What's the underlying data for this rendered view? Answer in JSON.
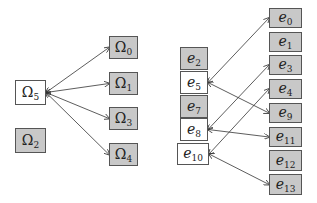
{
  "left_diagram": {
    "nodes": [
      {
        "id": "omega5",
        "base": "Ω",
        "sub": "5",
        "fill": "white",
        "x": 15,
        "y": 80,
        "w": 31,
        "h": 25
      },
      {
        "id": "omega2",
        "base": "Ω",
        "sub": "2",
        "fill": "gray",
        "x": 15,
        "y": 128,
        "w": 31,
        "h": 25
      },
      {
        "id": "omega0",
        "base": "Ω",
        "sub": "0",
        "fill": "gray",
        "x": 109,
        "y": 36,
        "w": 29,
        "h": 23
      },
      {
        "id": "omega1",
        "base": "Ω",
        "sub": "1",
        "fill": "gray",
        "x": 109,
        "y": 72,
        "w": 29,
        "h": 23
      },
      {
        "id": "omega3",
        "base": "Ω",
        "sub": "3",
        "fill": "gray",
        "x": 109,
        "y": 107,
        "w": 29,
        "h": 23
      },
      {
        "id": "omega4",
        "base": "Ω",
        "sub": "4",
        "fill": "gray",
        "x": 109,
        "y": 143,
        "w": 29,
        "h": 23
      }
    ],
    "edges": [
      {
        "from": "omega5",
        "to": "omega0",
        "type": "bidirectional"
      },
      {
        "from": "omega5",
        "to": "omega1",
        "type": "bidirectional"
      },
      {
        "from": "omega5",
        "to": "omega3",
        "type": "bidirectional"
      },
      {
        "from": "omega5",
        "to": "omega4",
        "type": "bidirectional"
      }
    ]
  },
  "right_diagram": {
    "nodes": [
      {
        "id": "e2",
        "base": "e",
        "sub": "2",
        "fill": "gray",
        "x": 180,
        "y": 47,
        "w": 28,
        "h": 23
      },
      {
        "id": "e5",
        "base": "e",
        "sub": "5",
        "fill": "white",
        "x": 180,
        "y": 71,
        "w": 28,
        "h": 23
      },
      {
        "id": "e7",
        "base": "e",
        "sub": "7",
        "fill": "gray",
        "x": 180,
        "y": 95,
        "w": 28,
        "h": 23
      },
      {
        "id": "e8",
        "base": "e",
        "sub": "8",
        "fill": "white",
        "x": 180,
        "y": 118,
        "w": 28,
        "h": 23
      },
      {
        "id": "e10",
        "base": "e",
        "sub": "10",
        "fill": "white",
        "x": 177,
        "y": 143,
        "w": 32,
        "h": 22
      },
      {
        "id": "e0",
        "base": "e",
        "sub": "0",
        "fill": "gray",
        "x": 269,
        "y": 8,
        "w": 33,
        "h": 20
      },
      {
        "id": "e1",
        "base": "e",
        "sub": "1",
        "fill": "gray",
        "x": 269,
        "y": 32,
        "w": 33,
        "h": 20
      },
      {
        "id": "e3",
        "base": "e",
        "sub": "3",
        "fill": "gray",
        "x": 269,
        "y": 55,
        "w": 33,
        "h": 20
      },
      {
        "id": "e4",
        "base": "e",
        "sub": "4",
        "fill": "gray",
        "x": 269,
        "y": 79,
        "w": 33,
        "h": 20
      },
      {
        "id": "e9",
        "base": "e",
        "sub": "9",
        "fill": "gray",
        "x": 269,
        "y": 103,
        "w": 33,
        "h": 20
      },
      {
        "id": "e11",
        "base": "e",
        "sub": "11",
        "fill": "gray",
        "x": 269,
        "y": 127,
        "w": 33,
        "h": 20
      },
      {
        "id": "e12",
        "base": "e",
        "sub": "12",
        "fill": "gray",
        "x": 269,
        "y": 150,
        "w": 33,
        "h": 21
      },
      {
        "id": "e13",
        "base": "e",
        "sub": "13",
        "fill": "gray",
        "x": 269,
        "y": 174,
        "w": 33,
        "h": 21
      }
    ],
    "edges": [
      {
        "from": "e5",
        "to": "e0",
        "type": "bidirectional"
      },
      {
        "from": "e5",
        "to": "e9",
        "type": "bidirectional"
      },
      {
        "from": "e8",
        "to": "e3",
        "type": "bidirectional"
      },
      {
        "from": "e8",
        "to": "e11",
        "type": "bidirectional"
      },
      {
        "from": "e10",
        "to": "e4",
        "type": "bidirectional"
      },
      {
        "from": "e10",
        "to": "e13",
        "type": "bidirectional"
      }
    ]
  },
  "colors": {
    "gray_fill": "#c8c8c8",
    "white_fill": "#ffffff",
    "stroke": "#555555",
    "edge": "#333333"
  }
}
